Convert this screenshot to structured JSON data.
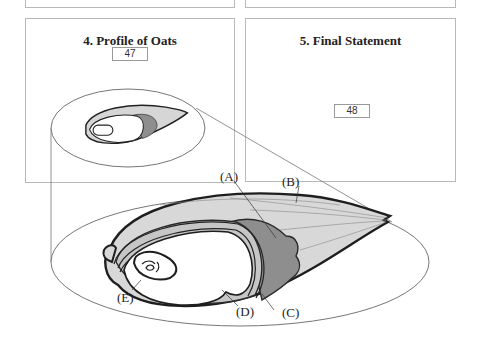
{
  "panels": [
    {
      "id": "profile",
      "title": "4. Profile of Oats",
      "number": "47"
    },
    {
      "id": "final",
      "title": "5. Final Statement",
      "number": "48"
    }
  ],
  "diagram": {
    "labels": {
      "A": "(A)",
      "B": "(B)",
      "C": "(C)",
      "D": "(D)",
      "E": "(E)"
    }
  },
  "colors": {
    "panel_border": "#b8b8b8",
    "outline": "#222222",
    "hull_light": "#d6d6d6",
    "hull_dark": "#8e8e8e",
    "bran": "#bdbdbd"
  }
}
